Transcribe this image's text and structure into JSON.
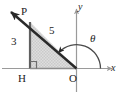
{
  "figure": {
    "background_color": "#ffffff",
    "stroke_color": "#2a2a2a",
    "axis_color": "#9a9a9a",
    "fill_color": "#d9d9d9",
    "points": {
      "P": {
        "label": "P",
        "x": -3,
        "y": 4
      },
      "H": {
        "label": "H",
        "x": -3,
        "y": 0
      },
      "O": {
        "label": "O",
        "x": 0,
        "y": 0
      }
    },
    "segments": {
      "PH": {
        "length_label": "3"
      },
      "PO": {
        "length_label": "5"
      },
      "HO": {
        "length_label": ""
      }
    },
    "angle": {
      "symbol": "θ",
      "vertex": "O",
      "from": "positive-x-axis",
      "to": "ray-OP",
      "direction": "counterclockwise"
    },
    "axes": {
      "x_label": "x",
      "y_label": "y"
    },
    "markers": {
      "right_angle_at": "H",
      "ray_arrow_beyond": "P"
    }
  }
}
